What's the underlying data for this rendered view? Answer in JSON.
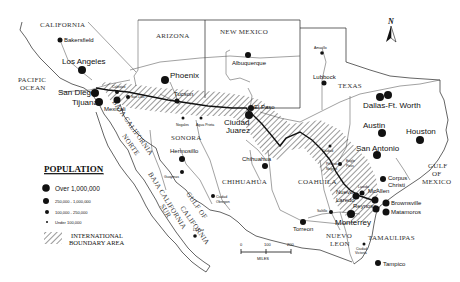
{
  "map": {
    "north_arrow_label": "N",
    "regions": {
      "california": "CALIFORNIA",
      "arizona": "ARIZONA",
      "new_mexico": "NEW MEXICO",
      "texas": "TEXAS",
      "sonora": "SONORA",
      "chihuahua": "CHIHUAHUA",
      "coahuila": "COAHUILA",
      "nuevo_leon_1": "NUEVO",
      "nuevo_leon_2": "LEON",
      "tamaulipas": "TAMAULIPAS",
      "baja_norte_1": "BAJA CALIFORNIA",
      "baja_norte_2": "NORTE",
      "baja_sur_1": "BAJA CALIFORNIA",
      "baja_sur_2": "SUR",
      "gulf_california_1": "GULF OF",
      "gulf_california_2": "CALIFORNIA",
      "pacific_1": "PACIFIC",
      "pacific_2": "OCEAN",
      "gulf_mexico_1": "GULF",
      "gulf_mexico_2": "OF",
      "gulf_mexico_3": "MEXICO"
    },
    "cities": {
      "bakersfield": "Bakersfield",
      "los_angeles": "Los Angeles",
      "san_diego": "San Diego",
      "tijuana": "Tijuana",
      "mexicali": "Mexicali",
      "calexico": "Calexico",
      "san_luis": "San Luis",
      "phoenix": "Phoenix",
      "tucson": "Tucson",
      "nogales": "Nogales",
      "agua_prieta": "Agua Prieta",
      "albuquerque": "Albuquerque",
      "el_paso": "El Paso",
      "ciudad_juarez_1": "Ciudad",
      "ciudad_juarez_2": "Juarez",
      "amarillo": "Amarillo",
      "lubbock": "Lubbock",
      "dallas": "Dallas-Ft. Worth",
      "austin": "Austin",
      "houston": "Houston",
      "san_antonio": "San Antonio",
      "hermosillo": "Hermosillo",
      "guaymas": "Guaymas",
      "ciudad_obregon_1": "Ciudad",
      "ciudad_obregon_2": "Obregon",
      "la_paz": "La Paz",
      "chihuahua": "Chihuahua",
      "ciudad_acuna_1": "Ciudad",
      "ciudad_acuna_2": "Acuna",
      "piedras_negras_1": "Piedras",
      "piedras_negras_2": "Negras",
      "eagle_pass_1": "Eagle",
      "eagle_pass_2": "Pass",
      "laredo": "Laredo",
      "nuevo_laredo_1": "Nuevo",
      "nuevo_laredo_2": "Laredo",
      "mcallen": "McAllen",
      "reynosa": "Reynosa",
      "brownsville": "Brownsville",
      "matamoros": "Matamoros",
      "corpus_christi_1": "Corpus",
      "corpus_christi_2": "Christi",
      "monterrey": "Monterrey",
      "saltillo": "Saltillo",
      "torreon": "Torreon",
      "ciudad_victoria_1": "Ciudad",
      "ciudad_victoria_2": "Victoria",
      "tampico": "Tampico"
    },
    "scale": {
      "ticks": [
        "0",
        "100",
        "200"
      ],
      "unit": "MILES"
    }
  },
  "legend": {
    "title": "POPULATION",
    "items": [
      {
        "label": "Over 1,000,000"
      },
      {
        "label": "250,000 - 1,000,000"
      },
      {
        "label": "100,000 - 250,000"
      },
      {
        "label": "Under 100,000"
      }
    ],
    "hatch_label_1": "INTERNATIONAL",
    "hatch_label_2": "BOUNDARY AREA"
  }
}
